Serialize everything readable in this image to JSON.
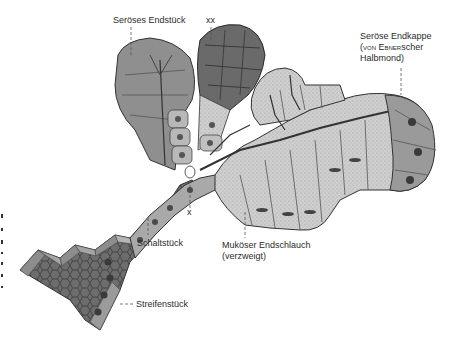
{
  "figure": {
    "labels": {
      "seroeses_endstueck": "Seröses Endstück",
      "xx": "xx",
      "seroese_endkappe_line1": "Seröse Endkappe",
      "seroese_endkappe_line2_prefix": "(von ",
      "seroese_endkappe_line2_name": "Ebner",
      "seroese_endkappe_line2_suffix": "scher",
      "seroese_endkappe_line3": "Halbmond)",
      "x": "x",
      "schaltstueck": "Schaltstück",
      "mukoeser_endschlauch_line1": "Muköser Endschlauch",
      "mukoeser_endschlauch_line2": "(verzweigt)",
      "streifenstueck": "Streifenstück"
    },
    "colors": {
      "background": "#ffffff",
      "serous_cells": "#8a8a8a",
      "mucous_cells": "#c8c8c8",
      "duct_wall": "#6e6e6e",
      "outline": "#333333",
      "nucleus": "#4a4a4a",
      "text": "#2b2b2b"
    }
  }
}
